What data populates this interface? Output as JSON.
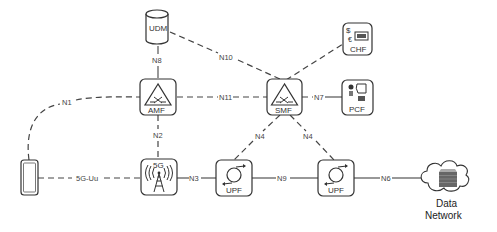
{
  "diagram": {
    "nodes": {
      "udm": {
        "label": "UDM",
        "icon": "database-cylinder-icon"
      },
      "amf": {
        "label": "AMF",
        "icon": "triangle-cross-icon"
      },
      "smf": {
        "label": "SMF",
        "icon": "triangle-cross-icon"
      },
      "chf": {
        "label": "CHF",
        "icon": "currency-card-icon",
        "symbols": [
          "$",
          "€"
        ]
      },
      "pcf": {
        "label": "PCF",
        "icon": "policy-icon"
      },
      "ue": {
        "label": "",
        "icon": "smartphone-icon"
      },
      "gnb": {
        "label": "5G",
        "icon": "radio-tower-icon"
      },
      "upf1": {
        "label": "UPF",
        "icon": "circular-arrows-icon"
      },
      "upf2": {
        "label": "UPF",
        "icon": "circular-arrows-icon"
      },
      "dn": {
        "label_line1": "Data",
        "label_line2": "Network",
        "icon": "cloud-server-icon"
      }
    },
    "links": [
      {
        "id": "n8",
        "label": "N8",
        "from": "UDM",
        "to": "AMF",
        "style": "dashed"
      },
      {
        "id": "n10",
        "label": "N10",
        "from": "UDM",
        "to": "SMF",
        "style": "dashed"
      },
      {
        "id": "n1",
        "label": "N1",
        "from": "UE",
        "to": "AMF",
        "style": "dashed"
      },
      {
        "id": "n11",
        "label": "N11",
        "from": "AMF",
        "to": "SMF",
        "style": "dashed"
      },
      {
        "id": "n7",
        "label": "N7",
        "from": "SMF",
        "to": "PCF",
        "style": "dashed"
      },
      {
        "id": "n40",
        "label": "N40",
        "from": "SMF",
        "to": "CHF",
        "style": "dashed"
      },
      {
        "id": "n2",
        "label": "N2",
        "from": "AMF",
        "to": "gNB",
        "style": "dashed"
      },
      {
        "id": "n4a",
        "label": "N4",
        "from": "SMF",
        "to": "UPF",
        "style": "dashed"
      },
      {
        "id": "n4b",
        "label": "N4",
        "from": "SMF",
        "to": "UPF",
        "style": "dashed"
      },
      {
        "id": "uu",
        "label": "5G-Uu",
        "from": "UE",
        "to": "gNB",
        "style": "dashed"
      },
      {
        "id": "n3",
        "label": "N3",
        "from": "gNB",
        "to": "UPF",
        "style": "solid"
      },
      {
        "id": "n9",
        "label": "N9",
        "from": "UPF",
        "to": "UPF",
        "style": "solid"
      },
      {
        "id": "n6",
        "label": "N6",
        "from": "UPF",
        "to": "Data Network",
        "style": "solid"
      }
    ]
  }
}
